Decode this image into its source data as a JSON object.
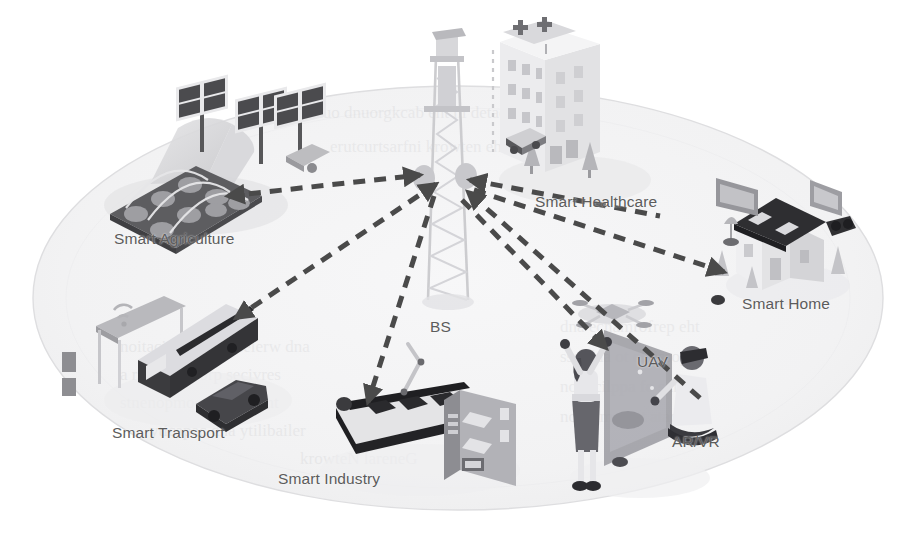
{
  "figure": {
    "kind": "isometric-illustration",
    "background_color": "#ffffff",
    "ground_ellipse_fill": "#f4f4f5",
    "ground_ellipse_stroke": "#dcdcdd",
    "arrow_color": "#4a4a4a",
    "label_color": "#5c5c5c"
  },
  "hub": {
    "name": "base-station",
    "label": "BS",
    "label_position": {
      "x": 430,
      "y": 318
    },
    "tower_position": {
      "x": 448,
      "y": 30
    },
    "antenna_hub": {
      "x": 444,
      "y": 186
    }
  },
  "nodes": [
    {
      "id": "smart-agriculture",
      "label": "Smart Agriculture",
      "icon": "greenhouse-solar-panels-icon",
      "label_position": {
        "x": 114,
        "y": 230
      },
      "anchor": {
        "x": 215,
        "y": 190
      },
      "link_direction": "bs-to-node"
    },
    {
      "id": "smart-healthcare",
      "label": "Smart Healthcare",
      "icon": "hospital-building-icon",
      "label_position": {
        "x": 535,
        "y": 193
      },
      "anchor": {
        "x": 520,
        "y": 188
      },
      "link_direction": "bs-to-node"
    },
    {
      "id": "smart-home",
      "label": "Smart Home",
      "icon": "house-icon",
      "label_position": {
        "x": 742,
        "y": 295
      },
      "anchor": {
        "x": 726,
        "y": 272
      },
      "link_direction": "bs-to-node"
    },
    {
      "id": "smart-transport",
      "label": "Smart Transport",
      "icon": "bus-and-car-icon",
      "label_position": {
        "x": 112,
        "y": 424
      },
      "anchor": {
        "x": 232,
        "y": 318
      },
      "link_direction": "bs-to-node"
    },
    {
      "id": "smart-industry",
      "label": "Smart Industry",
      "icon": "conveyor-belt-icon",
      "label_position": {
        "x": 278,
        "y": 470
      },
      "anchor": {
        "x": 368,
        "y": 402
      },
      "link_direction": "bs-to-node"
    },
    {
      "id": "uav",
      "label": "UAV",
      "icon": "drone-icon",
      "label_position": {
        "x": 637,
        "y": 353
      },
      "anchor": {
        "x": 628,
        "y": 350
      },
      "link_direction": "bs-to-node"
    },
    {
      "id": "ar-vr",
      "label": "AR/VR",
      "icon": "vr-headset-icon",
      "label_position": {
        "x": 672,
        "y": 433
      },
      "anchor": {
        "x": 700,
        "y": 400
      },
      "link_direction": "node-to-bs"
    }
  ],
  "links": [
    {
      "from": "smart-agriculture",
      "to": "base-station",
      "style": "dashed",
      "arrowheads": "both"
    },
    {
      "from": "base-station",
      "to": "smart-healthcare",
      "style": "dashed",
      "arrowheads": "single"
    },
    {
      "from": "base-station",
      "to": "smart-home",
      "style": "dashed",
      "arrowheads": "single"
    },
    {
      "from": "base-station",
      "to": "smart-transport",
      "style": "dashed",
      "arrowheads": "single"
    },
    {
      "from": "base-station",
      "to": "smart-industry",
      "style": "dashed",
      "arrowheads": "single"
    },
    {
      "from": "base-station",
      "to": "uav",
      "style": "dashed",
      "arrowheads": "single"
    },
    {
      "from": "ar-vr",
      "to": "base-station",
      "style": "dashed",
      "arrowheads": "single"
    }
  ]
}
